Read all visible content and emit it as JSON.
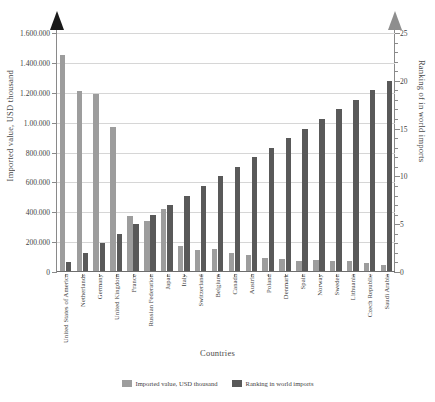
{
  "chart_data": {
    "type": "bar",
    "title": "",
    "xlabel": "Countries",
    "ylabel": "Imported value, USD thousand",
    "ylabel_right": "Ranking of in world imports",
    "categories": [
      "United States of America",
      "Netherlands",
      "Germany",
      "United Kingdom",
      "France",
      "Russian Federation",
      "Japan",
      "Italy",
      "Switzerland",
      "Belgium",
      "Canada",
      "Austria",
      "Poland",
      "Denmark",
      "Spain",
      "Norway",
      "Sweden",
      "Lithuania",
      "Czech Republic",
      "Saudi Arabia"
    ],
    "series": [
      {
        "name": "Imported value, USD thousand",
        "axis": "left",
        "color": "#9d9d9d",
        "values": [
          1452000,
          1212000,
          1192000,
          968000,
          372000,
          342000,
          420000,
          172000,
          150000,
          152000,
          130000,
          112000,
          96000,
          86000,
          76000,
          82000,
          74000,
          72000,
          62000,
          44000
        ]
      },
      {
        "name": "Ranking in world imports",
        "axis": "right",
        "color": "#595959",
        "values": [
          1,
          2,
          3,
          4,
          5,
          6,
          7,
          8,
          9,
          10,
          11,
          12,
          13,
          14,
          15,
          16,
          17,
          18,
          19,
          20
        ]
      }
    ],
    "ylim": [
      0,
      1600000
    ],
    "ylim_right": [
      0,
      25
    ],
    "yticks_left": [
      "0",
      "200.000",
      "400.000",
      "600.000",
      "800.000",
      "1.00.000",
      "1.200.000",
      "1.400.000",
      "1.600.000"
    ],
    "yticks_left_values": [
      0,
      200000,
      400000,
      600000,
      800000,
      1000000,
      1200000,
      1400000,
      1600000
    ],
    "yticks_right": [
      "0",
      "5",
      "10",
      "15",
      "20",
      "25"
    ],
    "yticks_right_values": [
      0,
      5,
      10,
      15,
      20,
      25
    ],
    "grid": true,
    "legend_position": "bottom"
  },
  "legend": {
    "items": [
      {
        "label": "Imported value, USD thousand",
        "color": "#9d9d9d"
      },
      {
        "label": "Ranking in world imports",
        "color": "#595959"
      }
    ]
  }
}
